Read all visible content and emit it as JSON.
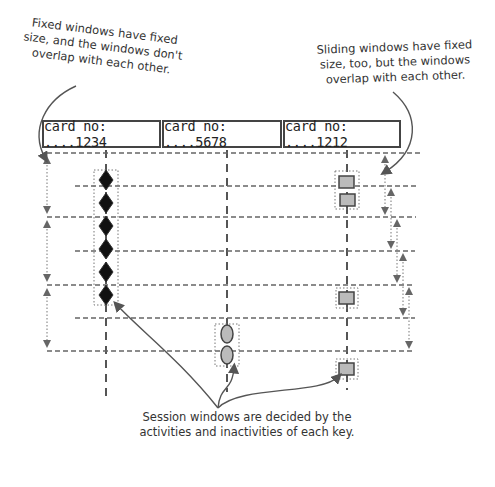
{
  "annotations": {
    "fixed_windows": "Fixed windows have fixed size, and the windows don't overlap with each other.",
    "sliding_windows": "Sliding windows have fixed size, too, but the windows overlap with each other.",
    "session_windows": "Session windows are decided by the activities and inactivities of each key."
  },
  "cards": [
    {
      "label": "card no: ....1234",
      "marker": "diamond"
    },
    {
      "label": "card no: ....5678",
      "marker": "oval"
    },
    {
      "label": "card no: ....1212",
      "marker": "square"
    }
  ],
  "colors": {
    "line": "#555555",
    "diamond_fill": "#111111",
    "marker_fill": "#bbbbbb",
    "text": "#333333"
  },
  "window_types": [
    "Fixed",
    "Sliding",
    "Session"
  ]
}
